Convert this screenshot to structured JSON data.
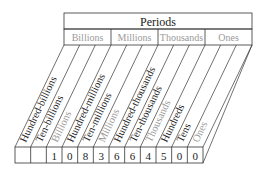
{
  "header": {
    "title": "Periods"
  },
  "periods": [
    {
      "label": "Billions",
      "color": "#9a9a9a"
    },
    {
      "label": "Millions",
      "color": "#9a9a9a"
    },
    {
      "label": "Thousands",
      "color": "#9a9a9a"
    },
    {
      "label": "Ones",
      "color": "#9a9a9a"
    }
  ],
  "places": [
    {
      "label": "Hundred-billions",
      "digit": "",
      "style": "dark"
    },
    {
      "label": "Ten-billions",
      "digit": "",
      "style": "dark"
    },
    {
      "label": "Billions",
      "digit": "1",
      "style": "gray"
    },
    {
      "label": "Hundred-millions",
      "digit": "0",
      "style": "dark"
    },
    {
      "label": "Ten-millions",
      "digit": "8",
      "style": "dark"
    },
    {
      "label": "Millions",
      "digit": "3",
      "style": "gray"
    },
    {
      "label": "Hundred-thousands",
      "digit": "6",
      "style": "dark"
    },
    {
      "label": "Ten-thousands",
      "digit": "6",
      "style": "dark"
    },
    {
      "label": "Thousands",
      "digit": "4",
      "style": "gray"
    },
    {
      "label": "Hundreds",
      "digit": "5",
      "style": "dark"
    },
    {
      "label": "Tens",
      "digit": "0",
      "style": "dark"
    },
    {
      "label": "Ones",
      "digit": "0",
      "style": "gray"
    }
  ],
  "colors": {
    "line": "#333333",
    "dark_text": "#222222",
    "gray_text": "#9a9a9a"
  }
}
